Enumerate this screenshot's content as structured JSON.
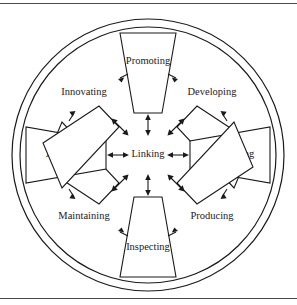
{
  "figure": {
    "type": "radial-wheel-diagram",
    "center_label": "Linking",
    "segments": [
      {
        "label": "Promoting",
        "position": "top",
        "angle_deg": 270
      },
      {
        "label": "Developing",
        "position": "upper-right",
        "angle_deg": 315
      },
      {
        "label": "Organising",
        "position": "right",
        "angle_deg": 0
      },
      {
        "label": "Producing",
        "position": "lower-right",
        "angle_deg": 45
      },
      {
        "label": "Inspecting",
        "position": "bottom",
        "angle_deg": 90
      },
      {
        "label": "Maintaining",
        "position": "lower-left",
        "angle_deg": 135
      },
      {
        "label": "Advising",
        "position": "left",
        "angle_deg": 180
      },
      {
        "label": "Innovating",
        "position": "upper-left",
        "angle_deg": 225
      }
    ],
    "colors": {
      "stroke": "#1a1a1a",
      "background": "#ffffff",
      "rule": "#4a4a4a"
    },
    "arrows": {
      "center_count": 8,
      "style": "double-headed",
      "boundary_style": "single-head"
    }
  }
}
